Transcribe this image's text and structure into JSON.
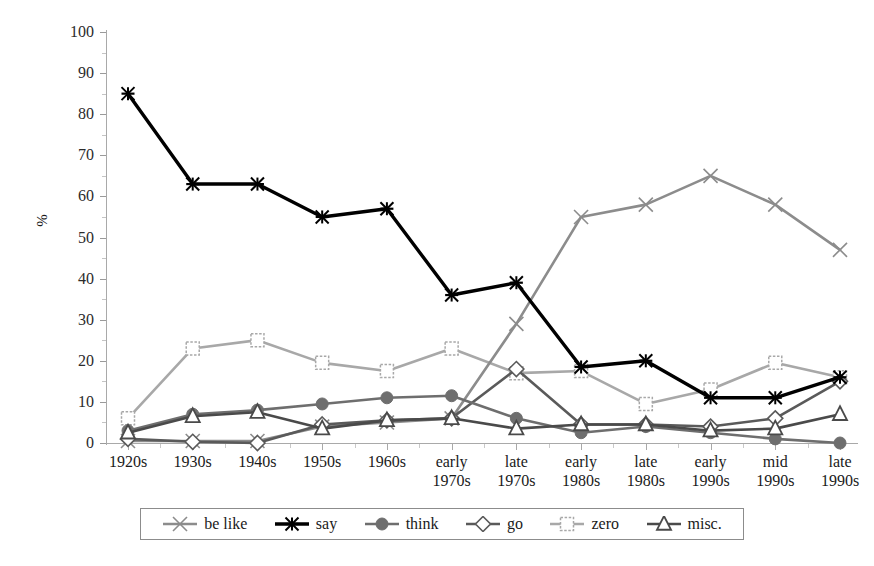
{
  "chart_data": {
    "type": "line",
    "title": "",
    "xlabel": "",
    "ylabel": "%",
    "ylim": [
      0,
      100
    ],
    "ytick_step": 10,
    "grid": false,
    "legend_position": "bottom",
    "categories": [
      "1920s",
      "1930s",
      "1940s",
      "1950s",
      "1960s",
      "early 1970s",
      "late 1970s",
      "early 1980s",
      "late 1980s",
      "early 1990s",
      "mid 1990s",
      "late 1990s"
    ],
    "yticks": [
      0,
      10,
      20,
      30,
      40,
      50,
      60,
      70,
      80,
      90,
      100
    ],
    "series": [
      {
        "name": "be like",
        "marker": "x",
        "color": "#8c8c8c",
        "values": [
          0.5,
          0.5,
          0.5,
          4,
          5,
          6,
          29,
          55,
          58,
          65,
          58,
          47
        ]
      },
      {
        "name": "say",
        "marker": "star-x",
        "color": "#000000",
        "values": [
          85,
          63,
          63,
          55,
          57,
          36,
          39,
          18.5,
          20,
          11,
          11,
          16
        ]
      },
      {
        "name": "think",
        "marker": "circle",
        "color": "#6e6e6e",
        "values": [
          3,
          7,
          8,
          9.5,
          11,
          11.5,
          6,
          2.5,
          4,
          2.5,
          1,
          0
        ]
      },
      {
        "name": "go",
        "marker": "diamond",
        "color": "#5a5a5a",
        "values": [
          1,
          0.3,
          0,
          4.5,
          5.5,
          6,
          18,
          4.5,
          4.5,
          4,
          6,
          15
        ]
      },
      {
        "name": "zero",
        "marker": "square",
        "color": "#a8a8a8",
        "values": [
          6,
          23,
          25,
          19.5,
          17.5,
          23,
          17,
          17.5,
          9.5,
          13,
          19.5,
          16
        ]
      },
      {
        "name": "misc.",
        "marker": "triangle",
        "color": "#4a4a4a",
        "values": [
          2.5,
          6.5,
          7.5,
          3.5,
          5.5,
          6,
          3.5,
          4.5,
          4.5,
          3,
          3.5,
          7
        ]
      }
    ]
  },
  "legend": {
    "items": [
      {
        "label": "be like"
      },
      {
        "label": "say"
      },
      {
        "label": "think"
      },
      {
        "label": "go"
      },
      {
        "label": "zero"
      },
      {
        "label": "misc."
      }
    ]
  }
}
